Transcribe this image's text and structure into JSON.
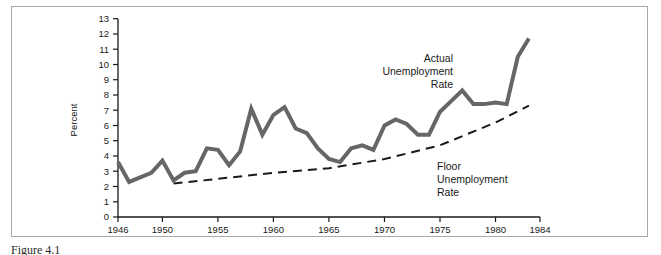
{
  "figure": {
    "caption": "Figure 4.1",
    "frame_color": "#a9a9a9",
    "background": "#ffffff"
  },
  "axes": {
    "y_axis_title": "Percent",
    "y_ticks": [
      "0",
      "1",
      "2",
      "3",
      "4",
      "5",
      "6",
      "7",
      "8",
      "9",
      "10",
      "11",
      "12",
      "13"
    ],
    "x_ticks": [
      "1946",
      "1950",
      "1955",
      "1960",
      "1965",
      "1970",
      "1975",
      "1980",
      "1984"
    ],
    "axis_color": "#1a1a1a"
  },
  "annotations": {
    "actual": {
      "line1": "Actual",
      "line2": "Unemployment",
      "line3": "Rate"
    },
    "floor": {
      "line1": "Floor",
      "line2": "Unemployment",
      "line3": "Rate"
    }
  },
  "chart_data": {
    "type": "line",
    "title": "",
    "subtitle": "",
    "xlabel": "",
    "ylabel": "Percent",
    "xlim": [
      1946,
      1984
    ],
    "ylim": [
      0,
      13
    ],
    "grid": false,
    "legend": "annotated-inline",
    "x_tick_values": [
      1946,
      1950,
      1955,
      1960,
      1965,
      1970,
      1975,
      1980,
      1984
    ],
    "y_tick_values": [
      0,
      1,
      2,
      3,
      4,
      5,
      6,
      7,
      8,
      9,
      10,
      11,
      12,
      13
    ],
    "series": [
      {
        "name": "Actual Unemployment Rate",
        "style": "solid",
        "color": "#666666",
        "line_width": 4,
        "x": [
          1946,
          1947,
          1948,
          1949,
          1950,
          1951,
          1952,
          1953,
          1954,
          1955,
          1956,
          1957,
          1958,
          1959,
          1960,
          1961,
          1962,
          1963,
          1964,
          1965,
          1966,
          1967,
          1968,
          1969,
          1970,
          1971,
          1972,
          1973,
          1974,
          1975,
          1976,
          1977,
          1978,
          1979,
          1980,
          1981,
          1982,
          1983
        ],
        "values": [
          3.6,
          2.3,
          2.6,
          2.9,
          3.7,
          2.4,
          2.9,
          3.0,
          4.5,
          4.4,
          3.4,
          4.3,
          7.1,
          5.4,
          6.7,
          7.2,
          5.8,
          5.5,
          4.5,
          3.8,
          3.6,
          4.5,
          4.7,
          4.4,
          6.0,
          6.4,
          6.1,
          5.4,
          5.4,
          6.9,
          7.6,
          8.3,
          7.4,
          7.4,
          7.5,
          7.4,
          10.5,
          11.7
        ]
      },
      {
        "name": "Floor Unemployment Rate",
        "style": "dashed",
        "color": "#1a1a1a",
        "line_width": 2,
        "x": [
          1951,
          1955,
          1960,
          1965,
          1970,
          1975,
          1980,
          1983
        ],
        "values": [
          2.2,
          2.5,
          2.9,
          3.2,
          3.8,
          4.7,
          6.2,
          7.3
        ]
      }
    ]
  }
}
